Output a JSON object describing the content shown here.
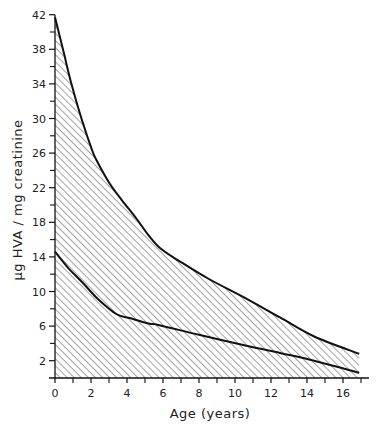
{
  "chart_data": {
    "type": "area",
    "title": "",
    "xlabel": "Age (years)",
    "ylabel": "µg HVA / mg creatinine",
    "xlim": [
      0,
      17
    ],
    "ylim": [
      0,
      42
    ],
    "x_ticks": [
      0,
      2,
      4,
      6,
      8,
      10,
      12,
      14,
      16
    ],
    "x_minor_ticks": [
      1,
      3,
      5,
      7,
      9,
      11,
      13,
      15,
      17
    ],
    "y_ticks": [
      2,
      6,
      10,
      14,
      18,
      22,
      26,
      30,
      34,
      38,
      42
    ],
    "y_minor_ticks": [
      4,
      8,
      12,
      16,
      20,
      24,
      28,
      32,
      36,
      40
    ],
    "grid": false,
    "legend": null,
    "fill": "diagonal hatch between upper and lower bounds",
    "series": [
      {
        "name": "upper bound",
        "x": [
          0,
          0.5,
          0.9,
          1.5,
          2.05,
          2.3,
          3.0,
          3.7,
          4.5,
          5.2,
          5.9,
          7.0,
          8.5,
          10.7,
          12.5,
          14.4,
          16.9
        ],
        "values": [
          41.7,
          37.5,
          34.1,
          29.8,
          26.4,
          25.2,
          22.6,
          20.6,
          18.5,
          16.5,
          14.9,
          13.4,
          11.5,
          9.1,
          7.0,
          4.8,
          2.8
        ]
      },
      {
        "name": "lower bound",
        "x": [
          0,
          0.7,
          1.5,
          2.4,
          3.4,
          4.2,
          5.2,
          5.8,
          8.0,
          10.7,
          12.5,
          14.4,
          16.9
        ],
        "values": [
          14.6,
          12.8,
          11.1,
          9.1,
          7.4,
          6.9,
          6.3,
          6.1,
          5.0,
          3.7,
          2.9,
          2.0,
          0.6
        ]
      }
    ]
  }
}
